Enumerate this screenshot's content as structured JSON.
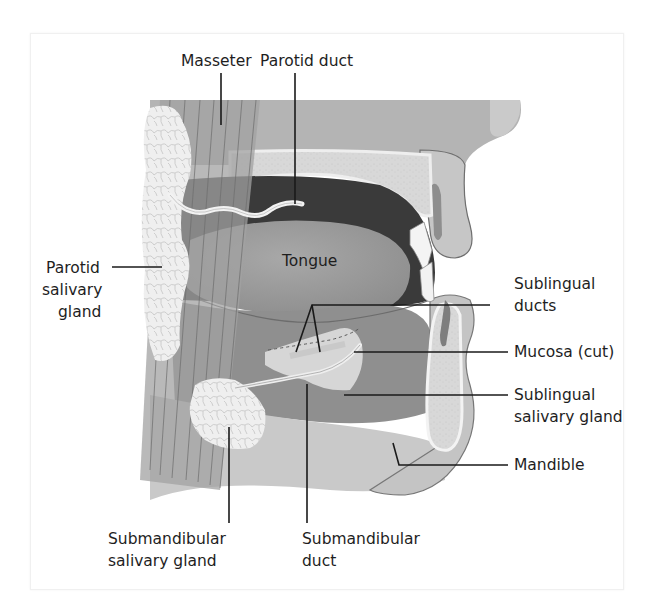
{
  "figure": {
    "labels": {
      "masseter": "Masseter",
      "parotid_duct": "Parotid duct",
      "parotid_gland_line1": "Parotid",
      "parotid_gland_line2": "salivary",
      "parotid_gland_line3": "gland",
      "tongue": "Tongue",
      "sublingual_ducts_line1": "Sublingual",
      "sublingual_ducts_line2": "ducts",
      "mucosa": "Mucosa (cut)",
      "sublingual_gland_line1": "Sublingual",
      "sublingual_gland_line2": "salivary gland",
      "mandible": "Mandible",
      "submandibular_gland_line1": "Submandibular",
      "submandibular_gland_line2": "salivary gland",
      "submandibular_duct_line1": "Submandibular",
      "submandibular_duct_line2": "duct"
    },
    "colors": {
      "background": "#ffffff",
      "leader_line": "#1a1a1a",
      "text": "#1e1e1e",
      "soft_tissue": "#b9b9b9",
      "dark_cavity": "#3d3d3d",
      "tongue": "#9a9a9a",
      "gland": "#eeeeee",
      "bone": "#d6d6d6",
      "lip": "#c4c4c4"
    }
  }
}
